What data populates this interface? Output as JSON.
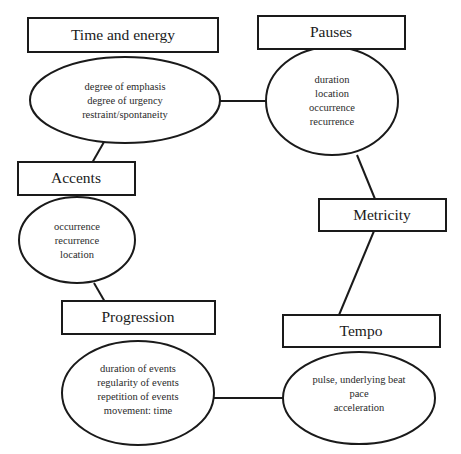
{
  "diagram": {
    "colors": {
      "stroke": "#1a1a1a",
      "background": "#ffffff",
      "text": "#1a1a1a"
    },
    "nodes": [
      {
        "id": "time-and-energy",
        "label": "Time and energy",
        "details": [
          "degree of emphasis",
          "degree of urgency",
          "restraint/spontaneity"
        ]
      },
      {
        "id": "pauses",
        "label": "Pauses",
        "details": [
          "duration",
          "location",
          "occurrence",
          "recurrence"
        ]
      },
      {
        "id": "accents",
        "label": "Accents",
        "details": [
          "occurrence",
          "recurrence",
          "location"
        ]
      },
      {
        "id": "metricity",
        "label": "Metricity",
        "details": []
      },
      {
        "id": "progression",
        "label": "Progression",
        "details": [
          "duration of events",
          "regularity of events",
          "repetition of events",
          "movement: time"
        ]
      },
      {
        "id": "tempo",
        "label": "Tempo",
        "details": [
          "pulse, underlying beat",
          "pace",
          "acceleration"
        ]
      }
    ],
    "edges": [
      {
        "from": "time-and-energy",
        "to": "pauses"
      },
      {
        "from": "time-and-energy",
        "to": "accents"
      },
      {
        "from": "pauses",
        "to": "metricity"
      },
      {
        "from": "accents",
        "to": "progression"
      },
      {
        "from": "metricity",
        "to": "tempo"
      },
      {
        "from": "progression",
        "to": "tempo"
      }
    ]
  }
}
